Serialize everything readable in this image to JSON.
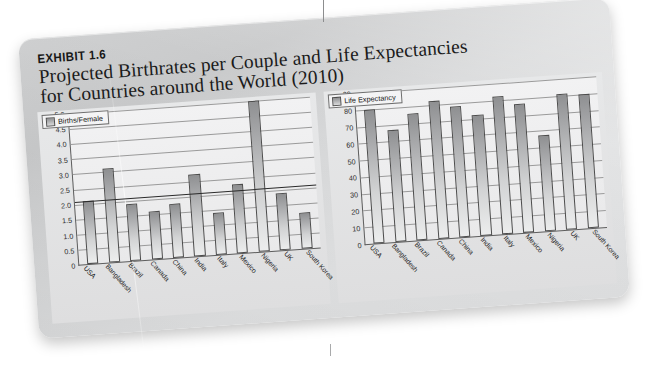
{
  "exhibit": {
    "label": "EXHIBIT 1.6",
    "title_line1": "Projected Birthrates per Couple and Life Expectancies",
    "title_line2": "for Countries around the World (2010)"
  },
  "colors": {
    "panel": "#d4d5d6",
    "plot_background": "#f0f0f1",
    "bar_top": "#8f9092",
    "bar_bottom": "#eceded",
    "axis": "#5d5d5d",
    "gridline": "#9a9a9a",
    "reference_line": "#2a2a2a",
    "text": "#1b1b1b"
  },
  "chart_data": [
    {
      "id": "births",
      "type": "bar",
      "title": "",
      "legend": "Births/Female",
      "legend_position": "top-left",
      "xlabel": "",
      "ylabel": "",
      "ylim": [
        0,
        5.0
      ],
      "yticks": [
        "5.0",
        "4.5",
        "4.0",
        "3.5",
        "3.0",
        "2.5",
        "2.0",
        "1.5",
        "1.0",
        "0.5",
        "0"
      ],
      "ytick_values": [
        5.0,
        4.5,
        4.0,
        3.5,
        3.0,
        2.5,
        2.0,
        1.5,
        1.0,
        0.5,
        0
      ],
      "grid": true,
      "reference_line": 2.1,
      "categories": [
        "USA",
        "Bangladesh",
        "Brazil",
        "Canada",
        "China",
        "India",
        "Italy",
        "Mexico",
        "Nigeria",
        "UK",
        "South Korea"
      ],
      "values": [
        2.1,
        3.1,
        1.9,
        1.6,
        1.8,
        2.7,
        1.4,
        2.3,
        5.0,
        1.9,
        1.2
      ]
    },
    {
      "id": "life-expectancy",
      "type": "bar",
      "title": "",
      "legend": "Life Expectancy",
      "legend_position": "top-left",
      "xlabel": "",
      "ylabel": "",
      "ylim": [
        0,
        90
      ],
      "yticks": [
        "90",
        "80",
        "70",
        "60",
        "50",
        "40",
        "30",
        "20",
        "10",
        "0"
      ],
      "ytick_values": [
        90,
        80,
        70,
        60,
        50,
        40,
        30,
        20,
        10,
        0
      ],
      "grid": true,
      "categories": [
        "USA",
        "Bangladesh",
        "Brazil",
        "Canada",
        "China",
        "India",
        "Italy",
        "Mexico",
        "Nigeria",
        "UK",
        "South Korea"
      ],
      "values": [
        80,
        67,
        76,
        82,
        78,
        72,
        82,
        77,
        57,
        81,
        80
      ]
    }
  ]
}
